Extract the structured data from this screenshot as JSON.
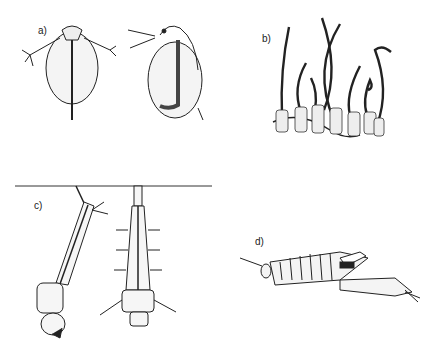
{
  "figure": {
    "panels": [
      {
        "id": "a",
        "label": "a)",
        "subject": "water flea (Daphnia) - dorsal and lateral views"
      },
      {
        "id": "b",
        "label": "b)",
        "subject": "tubificid worms in tubes"
      },
      {
        "id": "c",
        "label": "c)",
        "subject": "mosquito larvae hanging from water surface"
      },
      {
        "id": "d",
        "label": "d)",
        "subject": "fairy shrimp (Anostraca)"
      }
    ]
  }
}
